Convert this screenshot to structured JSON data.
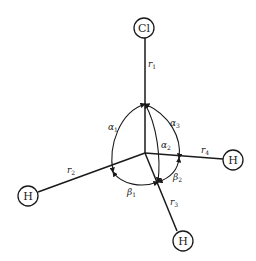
{
  "diagram": {
    "type": "molecular-geometry",
    "atoms": {
      "top": {
        "symbol": "Cl"
      },
      "left": {
        "symbol": "H"
      },
      "right": {
        "symbol": "H"
      },
      "bottom": {
        "symbol": "H"
      }
    },
    "bond_labels": {
      "r1": {
        "base": "r",
        "sub": "1"
      },
      "r2": {
        "base": "r",
        "sub": "2"
      },
      "r3": {
        "base": "r",
        "sub": "3"
      },
      "r4": {
        "base": "r",
        "sub": "4"
      }
    },
    "angle_labels": {
      "alpha1": {
        "base": "α",
        "sub": "1"
      },
      "alpha2": {
        "base": "α",
        "sub": "2"
      },
      "alpha3": {
        "base": "α",
        "sub": "3"
      },
      "beta1": {
        "base": "β",
        "sub": "1"
      },
      "beta2": {
        "base": "β",
        "sub": "2"
      }
    },
    "colors": {
      "stroke": "#1a1a1a",
      "background": "#ffffff"
    }
  }
}
